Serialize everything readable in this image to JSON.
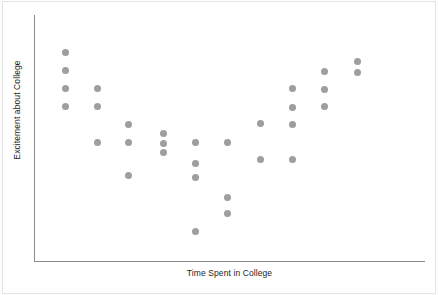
{
  "chart_data": {
    "type": "scatter",
    "title": "",
    "xlabel": "Time Spent in College",
    "ylabel": "Excitement about College",
    "grid": false,
    "legend": null,
    "axis_ticks": {
      "x": [],
      "y": []
    },
    "xlim": [
      0,
      12
    ],
    "ylim": [
      0,
      12
    ],
    "marker": {
      "shape": "circle",
      "color": "#9e9e9e",
      "size_px": 7
    },
    "relationship": "curvilinear (U-shaped / quadratic): excitement starts high, dips in the middle, and rises again",
    "n_points": 38,
    "points": [
      {
        "x": 1,
        "y": 10.4,
        "px": 65,
        "py": 52
      },
      {
        "x": 1,
        "y": 9.5,
        "px": 65,
        "py": 70
      },
      {
        "x": 1,
        "y": 8.6,
        "px": 65,
        "py": 88
      },
      {
        "x": 1,
        "y": 7.7,
        "px": 65,
        "py": 106
      },
      {
        "x": 2,
        "y": 8.6,
        "px": 97,
        "py": 88
      },
      {
        "x": 2,
        "y": 7.7,
        "px": 97,
        "py": 106
      },
      {
        "x": 2,
        "y": 5.9,
        "px": 97,
        "py": 142
      },
      {
        "x": 3,
        "y": 6.8,
        "px": 128,
        "py": 124
      },
      {
        "x": 3,
        "y": 5.9,
        "px": 128,
        "py": 142
      },
      {
        "x": 3,
        "y": 4.3,
        "px": 128,
        "py": 175
      },
      {
        "x": 4,
        "y": 6.4,
        "px": 163,
        "py": 133
      },
      {
        "x": 4,
        "y": 5.9,
        "px": 163,
        "py": 143
      },
      {
        "x": 4,
        "y": 5.4,
        "px": 163,
        "py": 152
      },
      {
        "x": 5,
        "y": 5.9,
        "px": 195,
        "py": 142
      },
      {
        "x": 5,
        "y": 5.2,
        "px": 195,
        "py": 163
      },
      {
        "x": 5,
        "y": 4.2,
        "px": 195,
        "py": 177
      },
      {
        "x": 5,
        "y": 1.5,
        "px": 195,
        "py": 231
      },
      {
        "x": 6,
        "y": 5.9,
        "px": 227,
        "py": 142
      },
      {
        "x": 6,
        "y": 3.2,
        "px": 227,
        "py": 197
      },
      {
        "x": 6,
        "y": 2.4,
        "px": 227,
        "py": 213
      },
      {
        "x": 7,
        "y": 6.8,
        "px": 260,
        "py": 123
      },
      {
        "x": 7,
        "y": 5.0,
        "px": 260,
        "py": 159
      },
      {
        "x": 8,
        "y": 8.6,
        "px": 292,
        "py": 88
      },
      {
        "x": 8,
        "y": 7.7,
        "px": 292,
        "py": 107
      },
      {
        "x": 8,
        "y": 6.8,
        "px": 292,
        "py": 124
      },
      {
        "x": 8,
        "y": 5.0,
        "px": 292,
        "py": 159
      },
      {
        "x": 9,
        "y": 9.5,
        "px": 324,
        "py": 71
      },
      {
        "x": 9,
        "y": 8.6,
        "px": 324,
        "py": 89
      },
      {
        "x": 9,
        "y": 7.7,
        "px": 324,
        "py": 106
      },
      {
        "x": 10,
        "y": 10.0,
        "px": 357,
        "py": 61
      },
      {
        "x": 10,
        "y": 9.4,
        "px": 357,
        "py": 72
      }
    ]
  },
  "chart": {
    "xlabel": "Time Spent in College",
    "ylabel": "Excitement about College"
  },
  "colors": {
    "marker": "#9e9e9e",
    "axis": "#8a8a8a",
    "text": "#1d1d1d",
    "background": "#ffffff"
  }
}
